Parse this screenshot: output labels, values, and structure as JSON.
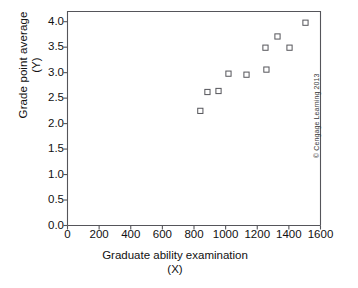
{
  "chart_data": {
    "type": "scatter",
    "title": "",
    "xlabel": "Graduate ability examination (X)",
    "ylabel": "Grade point average (Y)",
    "xlabel_line1": "Graduate ability examination",
    "xlabel_line2": "(X)",
    "ylabel_line1": "Grade point average",
    "ylabel_line2": "(Y)",
    "xlim": [
      0,
      1600
    ],
    "ylim": [
      0.0,
      4.2
    ],
    "xticks": [
      0,
      200,
      400,
      600,
      800,
      1000,
      1200,
      1400,
      1600
    ],
    "xtick_labels": [
      "0",
      "200",
      "400",
      "600",
      "800",
      "1000",
      "1200",
      "1400",
      "1600"
    ],
    "yticks": [
      0.0,
      0.5,
      1.0,
      1.5,
      2.0,
      2.5,
      3.0,
      3.5,
      4.0
    ],
    "ytick_labels": [
      "0.0",
      "0.5",
      "1.0",
      "1.5",
      "2.0",
      "2.5",
      "3.0",
      "3.5",
      "4.0"
    ],
    "grid": false,
    "legend": null,
    "marker": "open-square",
    "marker_color": "#55555a",
    "axis_color": "#55555a",
    "points": [
      {
        "x": 840,
        "y": 2.25
      },
      {
        "x": 885,
        "y": 2.62
      },
      {
        "x": 955,
        "y": 2.64
      },
      {
        "x": 1018,
        "y": 2.98
      },
      {
        "x": 1132,
        "y": 2.96
      },
      {
        "x": 1258,
        "y": 3.06
      },
      {
        "x": 1252,
        "y": 3.49
      },
      {
        "x": 1328,
        "y": 3.71
      },
      {
        "x": 1404,
        "y": 3.49
      },
      {
        "x": 1505,
        "y": 3.98
      }
    ]
  },
  "credit": {
    "text": "© Cengage Learning 2013"
  }
}
